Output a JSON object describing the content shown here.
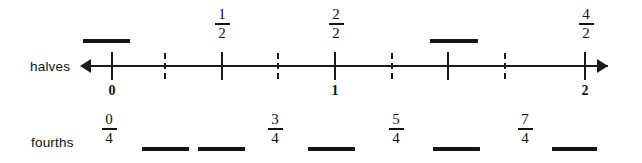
{
  "worksheet": {
    "rows": [
      {
        "id": "halves",
        "label": "halves"
      },
      {
        "id": "fourths",
        "label": "fourths"
      }
    ],
    "ink_color": "#1b1b1b",
    "background_color": "#ffffff"
  },
  "number_line": {
    "left_arrow_icon": "arrow-left-icon",
    "right_arrow_icon": "arrow-right-icon",
    "range_start": "0",
    "range_end": "2",
    "whole_labels": [
      {
        "value": "0",
        "x": 112
      },
      {
        "value": "1",
        "x": 335
      },
      {
        "value": "2",
        "x": 585
      }
    ],
    "ticks": [
      {
        "style": "solid",
        "x": 112,
        "value": "0/2"
      },
      {
        "style": "dashed",
        "x": 165,
        "value": "1/4"
      },
      {
        "style": "solid",
        "x": 222,
        "value": "1/2"
      },
      {
        "style": "dashed",
        "x": 278,
        "value": "3/4"
      },
      {
        "style": "solid",
        "x": 335,
        "value": "2/2"
      },
      {
        "style": "dashed",
        "x": 392,
        "value": "5/4"
      },
      {
        "style": "solid",
        "x": 448,
        "value": "3/2"
      },
      {
        "style": "dashed",
        "x": 505,
        "value": "7/4"
      },
      {
        "style": "solid",
        "x": 585,
        "value": "4/2"
      }
    ]
  },
  "halves_row": {
    "label": "halves",
    "fractions": [
      {
        "numerator": "1",
        "denominator": "2",
        "x": 222
      },
      {
        "numerator": "2",
        "denominator": "2",
        "x": 336
      },
      {
        "numerator": "4",
        "denominator": "2",
        "x": 586
      }
    ],
    "blanks": [
      {
        "x": 83,
        "width": 47
      },
      {
        "x": 430,
        "width": 48
      }
    ]
  },
  "fourths_row": {
    "label": "fourths",
    "fractions": [
      {
        "numerator": "0",
        "denominator": "4",
        "x": 109
      },
      {
        "numerator": "3",
        "denominator": "4",
        "x": 275
      },
      {
        "numerator": "5",
        "denominator": "4",
        "x": 396
      },
      {
        "numerator": "7",
        "denominator": "4",
        "x": 525
      }
    ],
    "blanks": [
      {
        "x": 142,
        "width": 47
      },
      {
        "x": 198,
        "width": 47
      },
      {
        "x": 308,
        "width": 47
      },
      {
        "x": 433,
        "width": 47
      },
      {
        "x": 552,
        "width": 45
      }
    ]
  }
}
